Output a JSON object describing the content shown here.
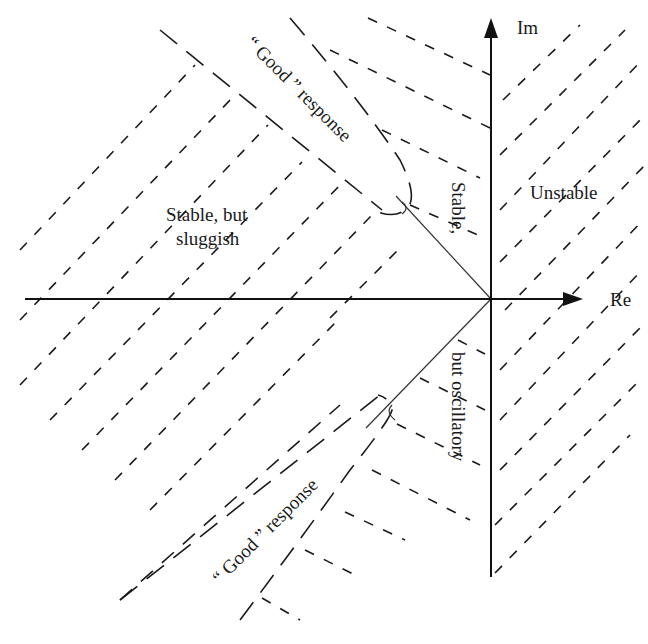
{
  "diagram": {
    "axes": {
      "real_label": "Re",
      "imag_label": "Im"
    },
    "regions": {
      "unstable": "Unstable",
      "sluggish_line1": "Stable, but",
      "sluggish_line2": "sluggish",
      "oscillatory_upper": "Stable,",
      "oscillatory_lower": "but oscillatory",
      "good_upper": "“ Good ” response",
      "good_lower": "“ Good ” response"
    },
    "colors": {
      "background": "#ffffff",
      "ink": "#1a1a1a"
    }
  }
}
